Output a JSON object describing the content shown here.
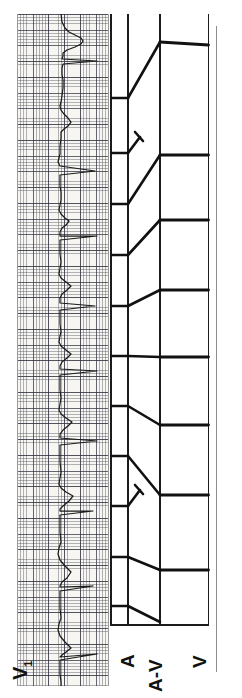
{
  "figure": {
    "kind": "ecg-ladder-diagram",
    "orientation": "rotated-90-ccw",
    "width": 242,
    "height": 698,
    "background": "#ffffff",
    "ink_color": "#111111",
    "paper_color": "#f7f6f3",
    "grid_fine_color": "#464650",
    "grid_bold_color": "#2d2d3c"
  },
  "ecg": {
    "lead_label": "V",
    "lead_subscript": "1",
    "strip_caption": "V1",
    "grid_fine_mm_px": 3.15,
    "grid_bold_mm_px": 15.75,
    "beat_count": 11,
    "qrs_positions_px": [
      47,
      157,
      222,
      292,
      357,
      427,
      497,
      572,
      640
    ],
    "p_wave_positions_px": [
      30,
      98,
      150,
      198,
      252,
      300,
      352,
      400,
      452,
      500,
      552,
      600
    ]
  },
  "ladder": {
    "title": "Ladder diagram",
    "tiers": [
      {
        "id": "A",
        "label": "A",
        "x_start": 0,
        "x_end": 18,
        "description": "atrial tier"
      },
      {
        "id": "AV",
        "label": "A-V",
        "x_start": 18,
        "x_end": 50,
        "description": "atrioventricular conduction tier"
      },
      {
        "id": "V",
        "label": "V",
        "x_start": 50,
        "x_end": 98,
        "description": "ventricular tier"
      }
    ],
    "atrial_marks_px": [
      28,
      85,
      140,
      190,
      242,
      292,
      342,
      392,
      442,
      492,
      543,
      592
    ],
    "ventricular_marks_px": [
      31,
      141,
      206,
      276,
      343,
      411,
      481,
      556
    ],
    "conduction_slopes": [
      {
        "from": 28,
        "to": 31,
        "conducted": true,
        "pr_trend": "short"
      },
      {
        "from": 85,
        "to": 141,
        "conducted": true,
        "pr_trend": "long"
      },
      {
        "from": 140,
        "to": 155,
        "conducted": false,
        "pr_trend": "blocked"
      },
      {
        "from": 190,
        "to": 206,
        "conducted": true,
        "pr_trend": "short"
      },
      {
        "from": 242,
        "to": 276,
        "conducted": true,
        "pr_trend": "longer"
      },
      {
        "from": 292,
        "to": 343,
        "conducted": true,
        "pr_trend": "longest"
      },
      {
        "from": 342,
        "to": 411,
        "conducted": true,
        "pr_trend": "short"
      },
      {
        "from": 392,
        "to": 481,
        "conducted": true,
        "pr_trend": "longer"
      },
      {
        "from": 442,
        "to": 556,
        "conducted": true,
        "pr_trend": "longest"
      },
      {
        "from": 492,
        "to": 508,
        "conducted": false,
        "pr_trend": "blocked"
      },
      {
        "from": 543,
        "to": 600,
        "conducted": true,
        "pr_trend": "short"
      }
    ],
    "blocked_beat_count": 2,
    "pattern": "Wenckebach (Mobitz type I) AV block"
  }
}
